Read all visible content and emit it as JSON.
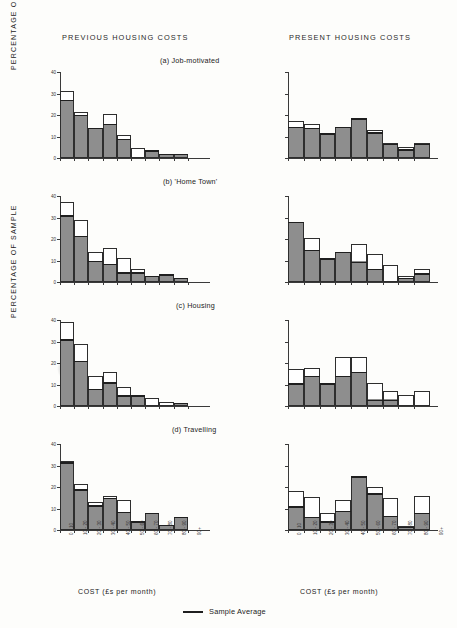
{
  "figure": {
    "column_headers": [
      "PREVIOUS HOUSING COSTS",
      "PRESENT HOUSING COSTS"
    ],
    "y_axis_label_top": "PERCENTAGE   OF   SAMPLE",
    "y_axis_label_bottom": "PERCENTAGE   OF   SAMPLE",
    "x_axis_title": "COST  (£s per month)",
    "legend_label": "Sample Average",
    "legend_marker": "horizontal-line",
    "y_ticks": [
      "0",
      "10",
      "20",
      "30",
      "40"
    ],
    "x_tick_labels": [
      "0 - 10",
      "10 - 20",
      "20 - 30",
      "30 - 40",
      "40 - 50",
      "50 - 60",
      "60 - 70",
      "70 - 80",
      "80 - 90",
      "90+"
    ],
    "panel_titles": [
      "(a) Job-motivated",
      "(b) 'Home Town'",
      "(c) Housing",
      "(d) Travelling"
    ]
  },
  "chart_data": {
    "type": "bar",
    "xlabel": "COST (£s per month)",
    "ylabel": "PERCENTAGE OF SAMPLE",
    "ylim": [
      0,
      40
    ],
    "yticks": [
      0,
      10,
      20,
      30,
      40
    ],
    "grid": false,
    "legend": [
      "Sample Average"
    ],
    "legend_position": "bottom-center",
    "categories": [
      "0 - 10",
      "10 - 20",
      "20 - 30",
      "30 - 40",
      "40 - 50",
      "50 - 60",
      "60 - 70",
      "70 - 80",
      "80 - 90",
      "90+"
    ],
    "panels": [
      {
        "id": "a-previous",
        "title": "(a) Job-motivated",
        "column": "PREVIOUS HOUSING COSTS",
        "categories": [
          "0 - 10",
          "10 - 20",
          "20 - 30",
          "30 - 40",
          "40 - 50",
          "50 - 60",
          "60 - 70",
          "70 - 80",
          "80 - 90",
          "90+"
        ],
        "values": [
          31,
          21.5,
          14,
          20.5,
          10.5,
          4.5,
          3.5,
          2,
          2,
          0
        ],
        "sample_average": [
          27,
          20,
          14,
          16,
          9,
          0,
          3.5,
          2,
          2,
          0
        ]
      },
      {
        "id": "a-present",
        "title": "(a) Job-motivated",
        "column": "PRESENT HOUSING COSTS",
        "categories": [
          "0 - 10",
          "10 - 20",
          "20 - 30",
          "30 - 40",
          "40 - 50",
          "50 - 60",
          "60 - 70",
          "70 - 80",
          "80 - 90"
        ],
        "values": [
          17,
          16,
          11.5,
          14.5,
          18.5,
          13,
          7,
          5,
          7
        ],
        "sample_average": [
          14.5,
          14,
          11.5,
          14.5,
          18.5,
          12,
          6.5,
          4,
          6.5
        ]
      },
      {
        "id": "b-previous",
        "title": "(b) 'Home Town'",
        "column": "PREVIOUS HOUSING COSTS",
        "categories": [
          "0 - 10",
          "10 - 20",
          "20 - 30",
          "30 - 40",
          "40 - 50",
          "50 - 60",
          "60 - 70",
          "70 - 80",
          "80 - 90",
          "90+"
        ],
        "values": [
          37,
          29,
          14,
          16,
          11,
          6,
          3,
          3.5,
          2,
          0
        ],
        "sample_average": [
          31,
          21.5,
          10,
          8.5,
          4.5,
          4.5,
          3,
          3.5,
          2,
          0
        ]
      },
      {
        "id": "b-present",
        "title": "(b) 'Home Town'",
        "column": "PRESENT HOUSING COSTS",
        "categories": [
          "0 - 10",
          "10 - 20",
          "20 - 30",
          "30 - 40",
          "40 - 50",
          "50 - 60",
          "60 - 70",
          "70 - 80",
          "80 - 90"
        ],
        "values": [
          28,
          20.5,
          11,
          14,
          17.5,
          13,
          8,
          3,
          6
        ],
        "sample_average": [
          28,
          15,
          11,
          14,
          9.5,
          6,
          0,
          2,
          4
        ]
      },
      {
        "id": "c-previous",
        "title": "(c) Housing",
        "column": "PREVIOUS HOUSING COSTS",
        "categories": [
          "0 - 10",
          "10 - 20",
          "20 - 30",
          "30 - 40",
          "40 - 50",
          "50 - 60",
          "60 - 70",
          "70 - 80",
          "80 - 90",
          "90+"
        ],
        "values": [
          39,
          29,
          14,
          16,
          9,
          5,
          3.5,
          2,
          1.5,
          0
        ],
        "sample_average": [
          31,
          21,
          8,
          11,
          5,
          5,
          0,
          0,
          1.5,
          0
        ]
      },
      {
        "id": "c-present",
        "title": "(c) Housing",
        "column": "PRESENT HOUSING COSTS",
        "categories": [
          "0 - 10",
          "10 - 20",
          "20 - 30",
          "30 - 40",
          "40 - 50",
          "50 - 60",
          "60 - 70",
          "70 - 80",
          "80 - 90"
        ],
        "values": [
          17,
          17.5,
          10.5,
          23,
          23,
          10.5,
          7,
          5,
          7
        ],
        "sample_average": [
          10.5,
          14,
          10.5,
          14,
          16,
          3,
          3,
          0,
          0
        ]
      },
      {
        "id": "d-previous",
        "title": "(d) Travelling",
        "column": "PREVIOUS HOUSING COSTS",
        "categories": [
          "0 - 10",
          "10 - 20",
          "20 - 30",
          "30 - 40",
          "40 - 50",
          "50 - 60",
          "60 - 70",
          "70 - 80",
          "80 - 90",
          "90+"
        ],
        "values": [
          32,
          21.5,
          13,
          16,
          14,
          4,
          8,
          2.5,
          6,
          0
        ],
        "sample_average": [
          31.5,
          19,
          11.5,
          15,
          8.5,
          4,
          8,
          2.5,
          6,
          0
        ]
      },
      {
        "id": "d-present",
        "title": "(d) Travelling",
        "column": "PRESENT HOUSING COSTS",
        "categories": [
          "0 - 10",
          "10 - 20",
          "20 - 30",
          "30 - 40",
          "40 - 50",
          "50 - 60",
          "60 - 70",
          "70 - 80",
          "80 - 90"
        ],
        "values": [
          18,
          15.5,
          8,
          14,
          25,
          20,
          15,
          2,
          16
        ],
        "sample_average": [
          11,
          6,
          4,
          9,
          25,
          17,
          6.5,
          1.5,
          8
        ]
      }
    ]
  }
}
